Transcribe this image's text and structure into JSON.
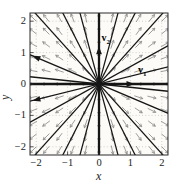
{
  "figure": {
    "background": "#ffffff",
    "plot_background": "#fcfbf7",
    "frame_color": "#2a2a2a",
    "tick_color": "#2a2a2a"
  },
  "labels": {
    "x": "x",
    "y": "y",
    "v1": {
      "base": "v",
      "sub": "1"
    },
    "v2": {
      "base": "v",
      "sub": "2"
    }
  },
  "ticks": {
    "x": [
      "−2",
      "−1",
      "0",
      "1",
      "2"
    ],
    "y": [
      "2",
      "1",
      "0",
      "−1",
      "−2"
    ]
  },
  "chart_data": {
    "type": "line",
    "subtype": "phase portrait / direction field of a planar linear system; unstable star node at the origin with eigenvectors v1=(1,0) and v2=(0,1)",
    "title": "",
    "xlabel": "x",
    "ylabel": "y",
    "xlim": [
      -2.2,
      2.2
    ],
    "ylim": [
      -2.26,
      2.26
    ],
    "x_ticks": [
      -2,
      -1,
      0,
      1,
      2
    ],
    "y_ticks": [
      2,
      1,
      0,
      -1,
      -2
    ],
    "grid": {
      "style": "dotted",
      "at": [
        -2,
        -1,
        1,
        2
      ],
      "color": "#b4b4b4"
    },
    "trajectories": {
      "description": "straight-line trajectories through the origin, flow directed outward",
      "angles_deg": [
        0,
        14,
        29,
        48,
        63,
        75,
        90,
        105,
        117,
        132,
        157,
        174
      ],
      "color": "#161616",
      "line_width": 1.25,
      "axis_line_width": 2.3
    },
    "eigenvector_arrows": [
      {
        "label": "v1",
        "tip": [
          1.13,
          0
        ],
        "angle_deg": 0
      },
      {
        "label": "v2",
        "tip": [
          0,
          1.2
        ],
        "angle_deg": 90
      }
    ],
    "extra_arrowheads": [
      {
        "pos": [
          -2.12,
          -0.53
        ],
        "angle_deg": 194
      },
      {
        "pos": [
          -2.12,
          0.9
        ],
        "angle_deg": 157
      }
    ],
    "vector_field": {
      "direction": "arrows point radially outward from the origin",
      "grid_start": -2.1,
      "grid_step": 0.42,
      "grid_count": 11,
      "arrow_len_px": 9,
      "head_len_px": 3.2,
      "color": "#8c8c8c"
    },
    "origin_dot_radius_px": 2.4
  }
}
